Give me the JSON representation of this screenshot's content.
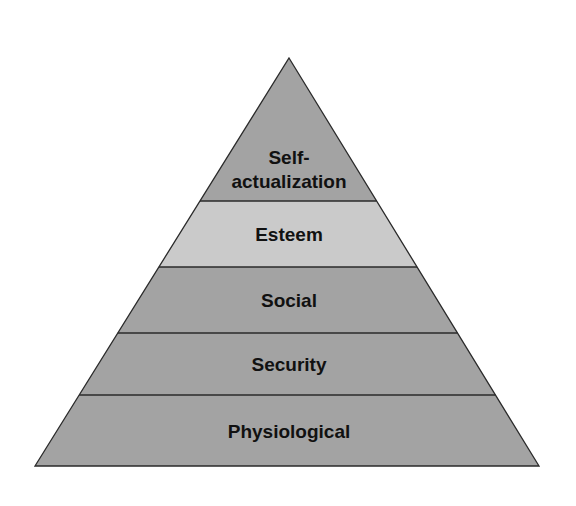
{
  "levels": [
    {
      "lines": [
        "Self-",
        "actualization"
      ],
      "color": "#a3a3a3"
    },
    {
      "lines": [
        "Esteem"
      ],
      "color": "#cacaca"
    },
    {
      "lines": [
        "Social"
      ],
      "color": "#a3a3a3"
    },
    {
      "lines": [
        "Security"
      ],
      "color": "#a3a3a3"
    },
    {
      "lines": [
        "Physiological"
      ],
      "color": "#a3a3a3"
    }
  ],
  "outline_color": "#2a2a2a"
}
